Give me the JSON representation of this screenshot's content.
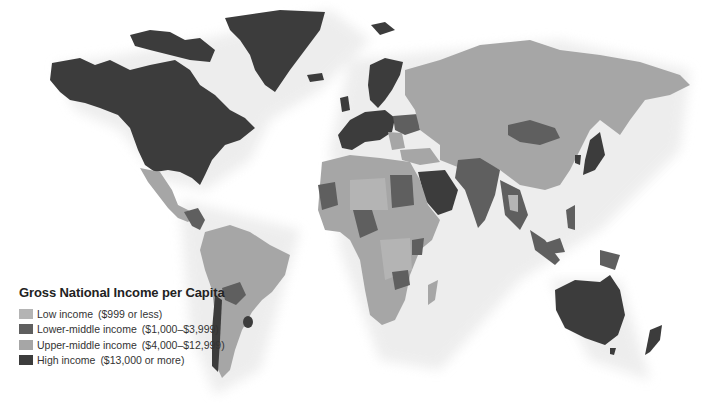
{
  "legend": {
    "title": "Gross National Income per Capita",
    "items": [
      {
        "label": "Low income",
        "range": "($999 or less)",
        "color": "#b4b4b4"
      },
      {
        "label": "Lower-middle income",
        "range": "($1,000–$3,999)",
        "color": "#5f5f5f"
      },
      {
        "label": "Upper-middle income",
        "range": "($4,000–$12,999)",
        "color": "#a6a6a6"
      },
      {
        "label": "High income",
        "range": "($13,000 or more)",
        "color": "#3c3c3c"
      }
    ]
  },
  "colors": {
    "low": "#b4b4b4",
    "lower_middle": "#5f5f5f",
    "upper_middle": "#a6a6a6",
    "high": "#3c3c3c",
    "ocean": "#ffffff"
  }
}
